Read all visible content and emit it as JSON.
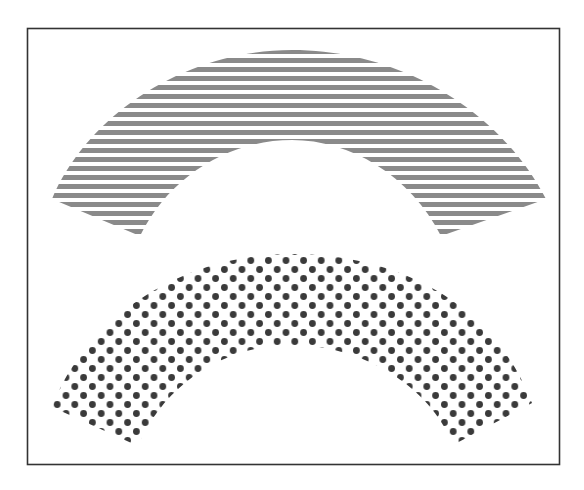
{
  "figure": {
    "frame": {
      "x": 27,
      "y": 28,
      "width": 533,
      "height": 437,
      "stroke": "#333333"
    },
    "shapes": [
      {
        "name": "upper-arch",
        "pattern": "horizontal-stripes",
        "color": "#8a8a8a",
        "stripe_pitch": 9,
        "stripe_thickness": 5
      },
      {
        "name": "lower-arch",
        "pattern": "dots",
        "color": "#3a3a3a",
        "dot_pitch_x": 17.5,
        "dot_pitch_y": 9,
        "dot_radius": 3.4
      }
    ]
  }
}
